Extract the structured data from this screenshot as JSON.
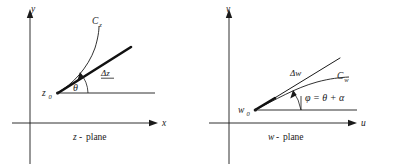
{
  "figure": {
    "panels": [
      {
        "id": "z-plane",
        "caption": "plane",
        "caption_variable": "z",
        "caption_separator": "-",
        "axes": {
          "horizontal_label": "x",
          "vertical_label": "y",
          "origin_x": 30,
          "origin_y": 123
        },
        "point_label": "z",
        "point_subscript": "0",
        "point_x": 57,
        "point_y": 93,
        "curve_label": "C",
        "curve_subscript": "z",
        "increment_label": "Δz",
        "angle_label": "θ",
        "angle_degrees": 28,
        "curve_style": "thin",
        "ray_style": "thick"
      },
      {
        "id": "w-plane",
        "caption": "plane",
        "caption_variable": "w",
        "caption_separator": "-",
        "axes": {
          "horizontal_label": "u",
          "vertical_label": "v",
          "origin_x": 32,
          "origin_y": 123
        },
        "point_label": "w",
        "point_subscript": "0",
        "point_x": 58,
        "point_y": 110,
        "curve_label": "C",
        "curve_subscript": "w",
        "increment_label": "Δw",
        "angle_label": "φ",
        "angle_equation": "φ = θ + α",
        "angle_degrees": 24,
        "curve_style": "thin",
        "ray_style": "thin"
      }
    ],
    "colors": {
      "ink": "#1a1a1a",
      "background": "#ffffff",
      "thick_ink": "#111111"
    }
  }
}
